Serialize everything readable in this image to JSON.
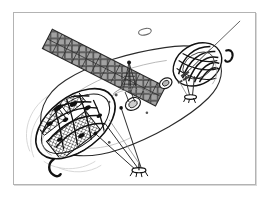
{
  "page": {
    "background_color": "#ffffff",
    "width": 268,
    "height": 199
  },
  "figure": {
    "frame": {
      "border_color": "#b3b3b3",
      "shadow_color": "#d9d9d9",
      "fill_color": "#ffffff",
      "x": 13,
      "y": 12,
      "width": 243,
      "height": 173
    },
    "title": "",
    "caption": "",
    "palette": {
      "ink": "#1a1a1a",
      "mid_gray": "#777777",
      "light_gray": "#bbbbbb",
      "faint_gray": "#dddddd",
      "panel_fill": "#8f8f8f",
      "panel_dark": "#5a5a5a",
      "white": "#ffffff"
    },
    "parts": [
      {
        "name": "solar-panel-array",
        "label": "",
        "orientation": "upper-left-diagonal",
        "cells": 22
      },
      {
        "name": "solar-panel-mast",
        "label": ""
      },
      {
        "name": "fuselage-body",
        "label": ""
      },
      {
        "name": "crew-capsule-nose",
        "label": ""
      },
      {
        "name": "cutaway-interior-structure",
        "label": ""
      },
      {
        "name": "landing-gear-forward",
        "label": ""
      },
      {
        "name": "landing-gear-aft",
        "label": ""
      },
      {
        "name": "landing-gear-mid",
        "label": ""
      },
      {
        "name": "hatch-port-large",
        "label": ""
      },
      {
        "name": "hatch-port-small",
        "label": ""
      },
      {
        "name": "antenna-boom",
        "label": ""
      },
      {
        "name": "detached-ring-marker",
        "label": ""
      },
      {
        "name": "hook-marker-right",
        "label": ""
      },
      {
        "name": "hook-marker-left",
        "label": ""
      },
      {
        "name": "ghost-outline-shroud",
        "label": ""
      }
    ]
  }
}
